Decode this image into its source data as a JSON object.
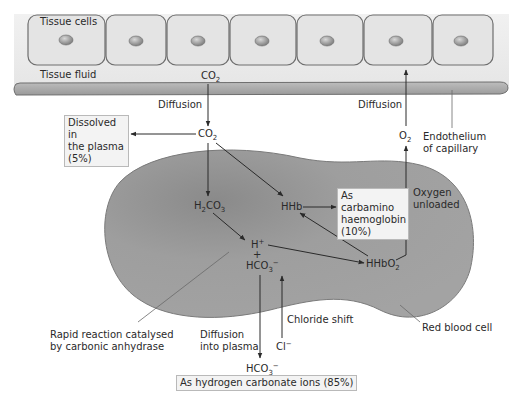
{
  "tissue": {
    "cells_label": "Tissue cells",
    "fluid_label": "Tissue fluid",
    "cell_count": 7
  },
  "capillary": {
    "endothelium_label_line1": "Endothelium",
    "endothelium_label_line2": "of capillary"
  },
  "flows": {
    "co2_top": {
      "main": "CO",
      "sub": "2"
    },
    "diffusion_left": "Diffusion",
    "diffusion_right": "Diffusion",
    "co2_mid": {
      "main": "CO",
      "sub": "2"
    },
    "o2": {
      "main": "O",
      "sub": "2"
    },
    "oxygen_unloaded_line1": "Oxygen",
    "oxygen_unloaded_line2": "unloaded"
  },
  "boxes": {
    "dissolved": {
      "line1": "Dissolved in",
      "line2": "the plasma",
      "line3": "(5%)"
    },
    "carbamino": {
      "line1": "As carbamino",
      "line2": "haemoglobin",
      "line3": "(10%)"
    },
    "hydrogen_carbonate": "As hydrogen carbonate ions (85%)"
  },
  "red_blood_cell": {
    "label": "Red blood cell",
    "species": {
      "h2co3": {
        "a": "H",
        "sub1": "2",
        "b": "CO",
        "sub2": "3"
      },
      "hhb": "HHb",
      "h_plus": {
        "main": "H",
        "sup": "+"
      },
      "plus": "+",
      "hco3": {
        "main": "HCO",
        "sub": "3",
        "sup": "−"
      },
      "hhbo2": {
        "main": "HHbO",
        "sub": "2"
      }
    }
  },
  "annotations": {
    "rapid_line1": "Rapid reaction catalysed",
    "rapid_line2": "by carbonic anhydrase",
    "diffusion_into_line1": "Diffusion",
    "diffusion_into_line2": "into plasma",
    "chloride_shift": "Chloride shift",
    "cl_minus": {
      "main": "Cl",
      "sup": "−"
    },
    "hco3_out": {
      "main": "HCO",
      "sub": "3",
      "sup": "−"
    }
  },
  "colors": {
    "cell_fill": "#e6e6e6",
    "cell_stroke": "#6e6e6e",
    "nucleus": "#9a9a9a",
    "capillary": "#a8a8a8",
    "rbc": "#9b9b9b",
    "box_fill": "#f3f3f3",
    "arrow": "#2a2a2a"
  }
}
